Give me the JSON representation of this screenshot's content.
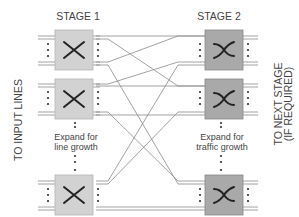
{
  "stage1": {
    "title": "STAGE 1",
    "expand_line1": "Expand for",
    "expand_line2": "line growth",
    "box_color": "#d2d2d2"
  },
  "stage2": {
    "title": "STAGE 2",
    "expand_line1": "Expand for",
    "expand_line2": "traffic growth",
    "box_color": "#a9a9a9"
  },
  "left_label": "TO INPUT LINES",
  "right_label_line1": "TO NEXT STAGE",
  "right_label_line2": "(IF REQUIRED)",
  "line_color": "#8a8a8a"
}
